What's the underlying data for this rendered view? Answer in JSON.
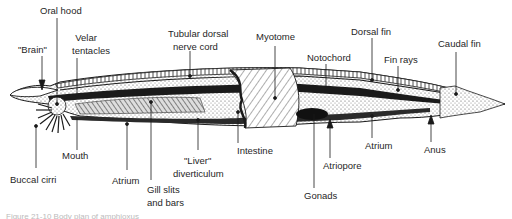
{
  "diagram": {
    "labels": {
      "oral_hood": "Oral hood",
      "brain": "\"Brain\"",
      "velar_tentacles_1": "Velar",
      "velar_tentacles_2": "tentacles",
      "nerve_cord_1": "Tubular dorsal",
      "nerve_cord_2": "nerve cord",
      "myotome": "Myotome",
      "notochord": "Notochord",
      "dorsal_fin": "Dorsal fin",
      "fin_rays": "Fin rays",
      "caudal_fin": "Caudal fin",
      "buccal_cirri": "Buccal cirri",
      "mouth": "Mouth",
      "atrium_front": "Atrium",
      "gill_1": "Gill slits",
      "gill_2": "and bars",
      "liver_1": "\"Liver\"",
      "liver_2": "diverticulum",
      "intestine": "Intestine",
      "gonads": "Gonads",
      "atriopore": "Atriopore",
      "atrium_rear": "Atrium",
      "anus": "Anus"
    },
    "caption": "Figure 21-10   Body plan of amphioxus"
  },
  "colors": {
    "ink": "#1a1a1a",
    "stipple": "#8a8a8a",
    "background": "#ffffff"
  }
}
